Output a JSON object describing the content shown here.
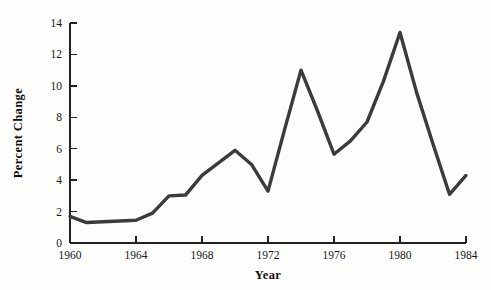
{
  "chart_data": {
    "type": "line",
    "title": "",
    "xlabel": "Year",
    "ylabel": "Percent Change",
    "xlim": [
      1960,
      1984
    ],
    "ylim": [
      0,
      14
    ],
    "xticks": [
      1960,
      1964,
      1968,
      1972,
      1976,
      1980,
      1984
    ],
    "xtick_labels": [
      "1960",
      "1964",
      "1968",
      "1972",
      "1976",
      "1980",
      "1984"
    ],
    "yticks": [
      0,
      2,
      4,
      6,
      8,
      10,
      12,
      14
    ],
    "ytick_labels": [
      "0",
      "2",
      "4",
      "6",
      "8",
      "10",
      "12",
      "14"
    ],
    "grid": false,
    "legend": false,
    "line_color": "#3b3b3b",
    "series": [
      {
        "name": "Percent Change",
        "x": [
          1960,
          1961,
          1962,
          1963,
          1964,
          1965,
          1966,
          1967,
          1968,
          1969,
          1970,
          1971,
          1972,
          1973,
          1974,
          1975,
          1976,
          1977,
          1978,
          1979,
          1980,
          1981,
          1982,
          1983,
          1984
        ],
        "values": [
          1.7,
          1.3,
          1.35,
          1.4,
          1.45,
          1.9,
          3.0,
          3.05,
          4.3,
          5.1,
          5.9,
          5.0,
          3.3,
          7.2,
          11.0,
          8.4,
          5.65,
          6.5,
          7.7,
          10.3,
          13.4,
          9.6,
          6.3,
          3.1,
          4.3
        ]
      }
    ]
  },
  "axes": {
    "y_title": "Percent Change",
    "x_title": "Year"
  }
}
